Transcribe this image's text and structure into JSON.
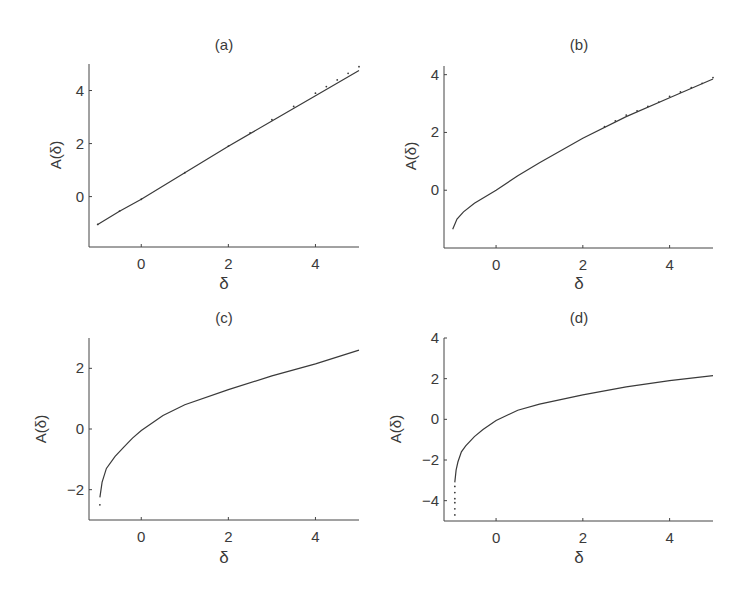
{
  "figure": {
    "panel_count": 4
  },
  "chart_data": [
    {
      "type": "line",
      "title": "(a)",
      "xlabel": "δ",
      "ylabel": "A(δ)",
      "xlim": [
        -1.2,
        5
      ],
      "ylim": [
        -1.9,
        5
      ],
      "xticks": [
        0,
        2,
        4
      ],
      "yticks": [
        0,
        2,
        4
      ],
      "grid": false,
      "series": [
        {
          "name": "solid",
          "style": "solid",
          "x": [
            -1,
            -0.5,
            0,
            1,
            2,
            3,
            4,
            5
          ],
          "y": [
            -1.05,
            -0.55,
            -0.1,
            0.9,
            1.9,
            2.85,
            3.8,
            4.75
          ]
        },
        {
          "name": "dotted",
          "style": "dots",
          "x": [
            -1,
            -0.5,
            0,
            1,
            2,
            2.5,
            3,
            3.5,
            4,
            4.25,
            4.5,
            4.75,
            5
          ],
          "y": [
            -1.05,
            -0.55,
            -0.1,
            0.9,
            1.9,
            2.4,
            2.9,
            3.4,
            3.9,
            4.15,
            4.4,
            4.65,
            4.9
          ]
        }
      ]
    },
    {
      "type": "line",
      "title": "(b)",
      "xlabel": "δ",
      "ylabel": "A(δ)",
      "xlim": [
        -1.2,
        5
      ],
      "ylim": [
        -2,
        4.3
      ],
      "xticks": [
        0,
        2,
        4
      ],
      "yticks": [
        0,
        2,
        4
      ],
      "grid": false,
      "series": [
        {
          "name": "solid",
          "style": "solid",
          "x": [
            -1,
            -0.9,
            -0.75,
            -0.5,
            0,
            0.5,
            1,
            2,
            3,
            4,
            5
          ],
          "y": [
            -1.35,
            -1.0,
            -0.75,
            -0.45,
            0.0,
            0.5,
            0.95,
            1.8,
            2.55,
            3.2,
            3.85
          ]
        },
        {
          "name": "dotted",
          "style": "dots",
          "x": [
            2.5,
            2.75,
            3,
            3.25,
            3.5,
            3.75,
            4,
            4.25,
            4.5,
            4.75,
            5
          ],
          "y": [
            2.2,
            2.4,
            2.6,
            2.75,
            2.9,
            3.05,
            3.25,
            3.4,
            3.55,
            3.7,
            3.9
          ]
        }
      ]
    },
    {
      "type": "line",
      "title": "(c)",
      "xlabel": "δ",
      "ylabel": "A(δ)",
      "xlim": [
        -1.2,
        5
      ],
      "ylim": [
        -3,
        3
      ],
      "xticks": [
        0,
        2,
        4
      ],
      "yticks": [
        -2,
        0,
        2
      ],
      "grid": false,
      "series": [
        {
          "name": "solid",
          "style": "solid",
          "x": [
            -0.95,
            -0.9,
            -0.8,
            -0.6,
            -0.4,
            -0.2,
            0,
            0.5,
            1,
            2,
            3,
            4,
            5
          ],
          "y": [
            -2.25,
            -1.75,
            -1.3,
            -0.9,
            -0.6,
            -0.3,
            -0.05,
            0.45,
            0.8,
            1.3,
            1.75,
            2.15,
            2.6
          ]
        },
        {
          "name": "dotted",
          "style": "dots",
          "x": [
            -0.95
          ],
          "y": [
            -2.5
          ]
        }
      ]
    },
    {
      "type": "line",
      "title": "(d)",
      "xlabel": "δ",
      "ylabel": "A(δ)",
      "xlim": [
        -1.2,
        5
      ],
      "ylim": [
        -5,
        4
      ],
      "xticks": [
        0,
        2,
        4
      ],
      "yticks": [
        -4,
        -2,
        0,
        2,
        4
      ],
      "grid": false,
      "series": [
        {
          "name": "solid",
          "style": "solid",
          "x": [
            -0.95,
            -0.92,
            -0.88,
            -0.8,
            -0.7,
            -0.5,
            -0.3,
            0,
            0.5,
            1,
            2,
            3,
            4,
            5
          ],
          "y": [
            -3.1,
            -2.5,
            -2.1,
            -1.6,
            -1.3,
            -0.85,
            -0.5,
            -0.05,
            0.45,
            0.75,
            1.2,
            1.6,
            1.9,
            2.15
          ]
        },
        {
          "name": "dotted",
          "style": "dots",
          "x": [
            -0.95,
            -0.95,
            -0.95,
            -0.95,
            -0.95,
            -0.95
          ],
          "y": [
            -3.3,
            -3.6,
            -3.9,
            -4.1,
            -4.4,
            -4.7
          ]
        }
      ]
    }
  ],
  "panels": [
    {
      "title": "(a)",
      "xlabel": "δ",
      "ylabel": "A(δ)",
      "xtick_labels": [
        "0",
        "2",
        "4"
      ],
      "ytick_labels": [
        "0",
        "2",
        "4"
      ]
    },
    {
      "title": "(b)",
      "xlabel": "δ",
      "ylabel": "A(δ)",
      "xtick_labels": [
        "0",
        "2",
        "4"
      ],
      "ytick_labels": [
        "0",
        "2",
        "4"
      ]
    },
    {
      "title": "(c)",
      "xlabel": "δ",
      "ylabel": "A(δ)",
      "xtick_labels": [
        "0",
        "2",
        "4"
      ],
      "ytick_labels": [
        "−2",
        "0",
        "2"
      ]
    },
    {
      "title": "(d)",
      "xlabel": "δ",
      "ylabel": "A(δ)",
      "xtick_labels": [
        "0",
        "2",
        "4"
      ],
      "ytick_labels": [
        "−4",
        "−2",
        "0",
        "2",
        "4"
      ]
    }
  ]
}
